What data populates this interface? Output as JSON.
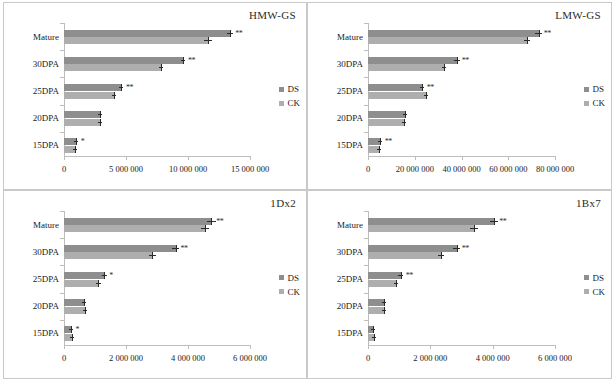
{
  "figure": {
    "categories": [
      "15DPA",
      "20DPA",
      "25DPA",
      "30DPA",
      "Mature"
    ],
    "legend": [
      {
        "label": "DS",
        "color": "#8e8e8e"
      },
      {
        "label": "CK",
        "color": "#aeaeae"
      }
    ]
  },
  "chart_data": [
    {
      "type": "bar",
      "title": "HMW-GS",
      "orientation": "horizontal",
      "xlabel": "",
      "ylabel": "",
      "xlim": [
        0,
        15000000
      ],
      "ticks": [
        0,
        5000000,
        10000000,
        15000000
      ],
      "tick_labels": [
        "0",
        "5 000 000",
        "10 000 000",
        "15 000 000"
      ],
      "categories": [
        "15DPA",
        "20DPA",
        "25DPA",
        "30DPA",
        "Mature"
      ],
      "grid": false,
      "legend_position": "right",
      "series": [
        {
          "name": "DS",
          "color": "#8e8e8e",
          "values": [
            950000,
            2900000,
            4600000,
            9600000,
            13400000
          ],
          "errors": [
            60000,
            90000,
            130000,
            170000,
            220000
          ]
        },
        {
          "name": "CK",
          "color": "#aeaeae",
          "values": [
            850000,
            2900000,
            4000000,
            7800000,
            11600000
          ],
          "errors": [
            50000,
            80000,
            110000,
            140000,
            300000
          ]
        }
      ],
      "significance": [
        "*",
        "",
        "**",
        "**",
        "**"
      ]
    },
    {
      "type": "bar",
      "title": "LMW-GS",
      "orientation": "horizontal",
      "xlabel": "",
      "ylabel": "",
      "xlim": [
        0,
        80000000
      ],
      "ticks": [
        0,
        20000000,
        40000000,
        60000000,
        80000000
      ],
      "tick_labels": [
        "0",
        "20 000 000",
        "40 000 000",
        "60 000 000",
        "80 000 000"
      ],
      "categories": [
        "15DPA",
        "20DPA",
        "25DPA",
        "30DPA",
        "Mature"
      ],
      "grid": false,
      "legend_position": "right",
      "series": [
        {
          "name": "DS",
          "color": "#8e8e8e",
          "values": [
            5000000,
            16000000,
            23000000,
            38000000,
            73000000
          ],
          "errors": [
            500000,
            700000,
            900000,
            1200000,
            1500000
          ]
        },
        {
          "name": "CK",
          "color": "#aeaeae",
          "values": [
            4500000,
            15500000,
            25000000,
            32500000,
            68000000
          ],
          "errors": [
            400000,
            600000,
            800000,
            1000000,
            1300000
          ]
        }
      ],
      "significance": [
        "**",
        "",
        "**",
        "**",
        "**"
      ]
    },
    {
      "type": "bar",
      "title": "1Dx2",
      "orientation": "horizontal",
      "xlabel": "",
      "ylabel": "",
      "xlim": [
        0,
        6000000
      ],
      "ticks": [
        0,
        2000000,
        4000000,
        6000000
      ],
      "tick_labels": [
        "0",
        "2 000 000",
        "4 000 000",
        "6 000 000"
      ],
      "categories": [
        "15DPA",
        "20DPA",
        "25DPA",
        "30DPA",
        "Mature"
      ],
      "grid": false,
      "legend_position": "right",
      "series": [
        {
          "name": "DS",
          "color": "#8e8e8e",
          "values": [
            210000,
            660000,
            1300000,
            3600000,
            4750000
          ],
          "errors": [
            40000,
            60000,
            90000,
            120000,
            150000
          ]
        },
        {
          "name": "CK",
          "color": "#aeaeae",
          "values": [
            260000,
            690000,
            1110000,
            2850000,
            4550000
          ],
          "errors": [
            40000,
            60000,
            80000,
            110000,
            130000
          ]
        }
      ],
      "significance": [
        "*",
        "",
        "*",
        "**",
        "**"
      ]
    },
    {
      "type": "bar",
      "title": "1Bx7",
      "orientation": "horizontal",
      "xlabel": "",
      "ylabel": "",
      "xlim": [
        0,
        6000000
      ],
      "ticks": [
        0,
        2000000,
        4000000,
        6000000
      ],
      "tick_labels": [
        "0",
        "2 000 000",
        "4 000 000",
        "6 000 000"
      ],
      "categories": [
        "15DPA",
        "20DPA",
        "25DPA",
        "30DPA",
        "Mature"
      ],
      "grid": false,
      "legend_position": "right",
      "series": [
        {
          "name": "DS",
          "color": "#8e8e8e",
          "values": [
            150000,
            500000,
            1050000,
            2850000,
            4050000
          ],
          "errors": [
            30000,
            50000,
            80000,
            110000,
            130000
          ]
        },
        {
          "name": "CK",
          "color": "#aeaeae",
          "values": [
            185000,
            505000,
            900000,
            2350000,
            3400000
          ],
          "errors": [
            30000,
            50000,
            70000,
            100000,
            120000
          ]
        }
      ],
      "significance": [
        "",
        "",
        "**",
        "**",
        "**"
      ]
    }
  ]
}
